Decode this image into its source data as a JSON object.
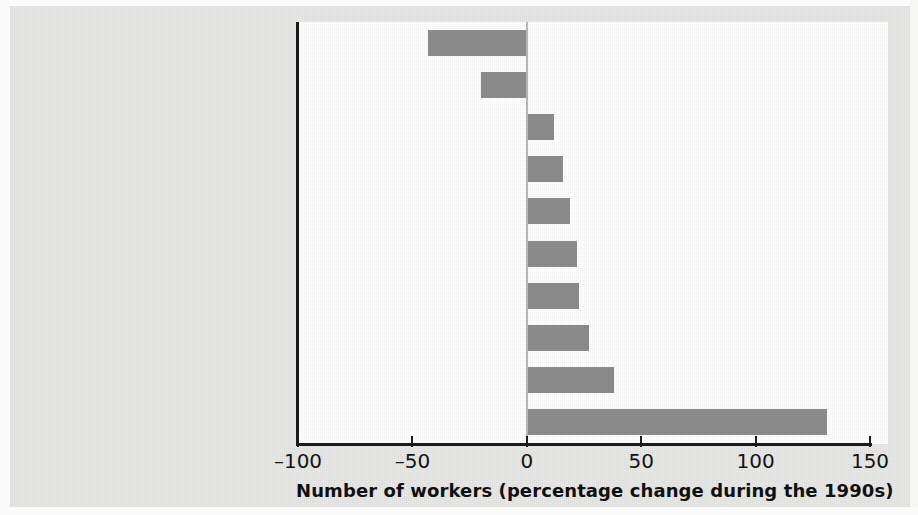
{
  "chart_data": {
    "type": "bar",
    "orientation": "horizontal",
    "title": "",
    "xlabel": "Number of workers (percentage change during the 1990s)",
    "ylabel": "",
    "categories": [
      "Coal mining",
      "Steel",
      "Retail trade",
      "Advertising",
      "Eating and drinking places",
      "Construction",
      "Automobiles",
      "Auto repair services",
      "Doctors' offices",
      "Computer and data services"
    ],
    "values": [
      -43,
      -20,
      12,
      16,
      19,
      22,
      23,
      27,
      38,
      131
    ],
    "xlim": [
      -100,
      158
    ],
    "xticks": [
      -100,
      -50,
      0,
      50,
      100,
      150
    ],
    "xtick_labels": [
      "–100",
      "–50",
      "0",
      "50",
      "100",
      "150"
    ],
    "grid": false,
    "legend": false,
    "bar_color": "#8d8d8d",
    "axis_color": "#1b1b1b",
    "plot_background": "#ffffff",
    "figure_background": "#e8e8e6"
  }
}
